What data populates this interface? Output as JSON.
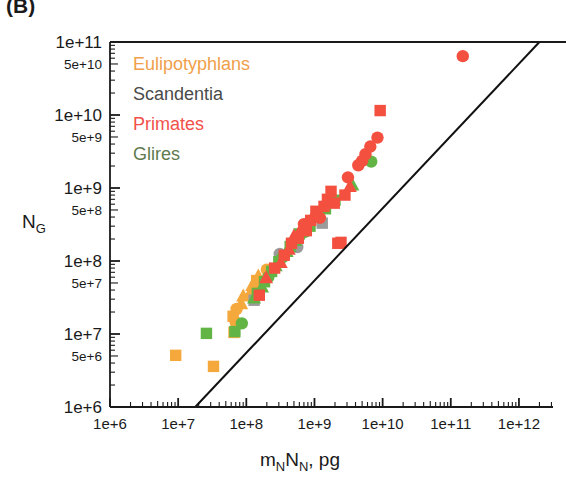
{
  "panel": {
    "label": "(B)"
  },
  "chart_data": {
    "type": "scatter",
    "title": "",
    "subtitle": "",
    "xlabel": "m_N N_N, pg",
    "xlabel_parts": {
      "m": "m",
      "msub": "N",
      "n": "N",
      "nsub": "N",
      "unit": ", pg"
    },
    "ylabel": "N_G",
    "ylabel_parts": {
      "base": "N",
      "sub": "G"
    },
    "xscale": "log",
    "yscale": "log",
    "xlim": [
      1000000.0,
      3160000000000.0
    ],
    "ylim": [
      1000000.0,
      100000000000.0
    ],
    "grid": false,
    "legend_position": "top-left",
    "x_major_ticks": [
      1000000,
      10000000,
      100000000,
      1000000000,
      10000000000,
      100000000000,
      1000000000000
    ],
    "x_tick_labels": [
      "1e+6",
      "1e+7",
      "1e+8",
      "1e+9",
      "1e+10",
      "1e+11",
      "1e+12"
    ],
    "y_major_ticks": [
      1000000,
      10000000,
      100000000,
      1000000000,
      10000000000,
      100000000000
    ],
    "y_major_labels": [
      "1e+6",
      "1e+7",
      "1e+8",
      "1e+9",
      "1e+10",
      "1e+11"
    ],
    "y_minor_ticks": [
      5000000,
      50000000,
      500000000,
      5000000000,
      50000000000
    ],
    "y_minor_labels": [
      "5e+6",
      "5e+7",
      "5e+8",
      "5e+9",
      "5e+10"
    ],
    "fit_line": {
      "x1": 17800000.0,
      "y1": 1000000,
      "x2": 2000000000000.0,
      "y2": 100000000000.0,
      "color": "#111111"
    },
    "legend": [
      {
        "name": "Eulipotyphlans",
        "color": "#F0A04B"
      },
      {
        "name": "Scandentia",
        "color": "#4A4A4A"
      },
      {
        "name": "Primates",
        "color": "#F2504B"
      },
      {
        "name": "Glires",
        "color": "#5E7A4E"
      }
    ],
    "marker_colors": {
      "Eulipotyphlans": "#F5A83C",
      "Scandentia": "#9B9B9B",
      "Primates": "#F4503F",
      "Glires": "#62B544"
    },
    "series": [
      {
        "name": "Eulipotyphlans",
        "color": "#F5A83C",
        "points": [
          {
            "x": 9200000.0,
            "y": 5100000.0,
            "marker": "square"
          },
          {
            "x": 33000000.0,
            "y": 3600000.0,
            "marker": "square"
          },
          {
            "x": 66000000.0,
            "y": 10500000.0,
            "marker": "square"
          },
          {
            "x": 70000000.0,
            "y": 14500000.0,
            "marker": "circle"
          },
          {
            "x": 64000000.0,
            "y": 17500000.0,
            "marker": "square"
          },
          {
            "x": 72000000.0,
            "y": 22000000.0,
            "marker": "circle"
          },
          {
            "x": 84000000.0,
            "y": 26000000.0,
            "marker": "triangle"
          },
          {
            "x": 90000000.0,
            "y": 33000000.0,
            "marker": "triangle"
          },
          {
            "x": 115000000.0,
            "y": 37000000.0,
            "marker": "triangle"
          },
          {
            "x": 122000000.0,
            "y": 46000000.0,
            "marker": "triangle"
          },
          {
            "x": 135000000.0,
            "y": 41000000.0,
            "marker": "circle"
          },
          {
            "x": 142000000.0,
            "y": 54000000.0,
            "marker": "square"
          },
          {
            "x": 150000000.0,
            "y": 62000000.0,
            "marker": "triangle"
          },
          {
            "x": 162000000.0,
            "y": 50000000.0,
            "marker": "circle"
          },
          {
            "x": 200000000.0,
            "y": 76000000.0,
            "marker": "circle"
          }
        ]
      },
      {
        "name": "Scandentia",
        "color": "#9B9B9B",
        "points": [
          {
            "x": 130000000.0,
            "y": 29000000.0,
            "marker": "square"
          },
          {
            "x": 310000000.0,
            "y": 125000000.0,
            "marker": "circle"
          },
          {
            "x": 560000000.0,
            "y": 155000000.0,
            "marker": "circle"
          },
          {
            "x": 1300000000.0,
            "y": 330000000.0,
            "marker": "square"
          }
        ]
      },
      {
        "name": "Primates",
        "color": "#F4503F",
        "points": [
          {
            "x": 155000000.0,
            "y": 34000000.0,
            "marker": "square"
          },
          {
            "x": 195000000.0,
            "y": 59000000.0,
            "marker": "triangle"
          },
          {
            "x": 260000000.0,
            "y": 80000000.0,
            "marker": "square"
          },
          {
            "x": 320000000.0,
            "y": 95000000.0,
            "marker": "triangle"
          },
          {
            "x": 360000000.0,
            "y": 120000000.0,
            "marker": "square"
          },
          {
            "x": 420000000.0,
            "y": 145000000.0,
            "marker": "triangle"
          },
          {
            "x": 460000000.0,
            "y": 175000000.0,
            "marker": "square"
          },
          {
            "x": 500000000.0,
            "y": 220000000.0,
            "marker": "triangle"
          },
          {
            "x": 580000000.0,
            "y": 205000000.0,
            "marker": "square"
          },
          {
            "x": 640000000.0,
            "y": 280000000.0,
            "marker": "triangle"
          },
          {
            "x": 700000000.0,
            "y": 320000000.0,
            "marker": "circle"
          },
          {
            "x": 760000000.0,
            "y": 260000000.0,
            "marker": "square"
          },
          {
            "x": 880000000.0,
            "y": 360000000.0,
            "marker": "square"
          },
          {
            "x": 960000000.0,
            "y": 420000000.0,
            "marker": "triangle"
          },
          {
            "x": 1050000000.0,
            "y": 480000000.0,
            "marker": "square"
          },
          {
            "x": 1200000000.0,
            "y": 390000000.0,
            "marker": "circle"
          },
          {
            "x": 1380000000.0,
            "y": 560000000.0,
            "marker": "square"
          },
          {
            "x": 1550000000.0,
            "y": 700000000.0,
            "marker": "square"
          },
          {
            "x": 1750000000.0,
            "y": 900000000.0,
            "marker": "square"
          },
          {
            "x": 1950000000.0,
            "y": 620000000.0,
            "marker": "square"
          },
          {
            "x": 2200000000.0,
            "y": 175000000.0,
            "marker": "square"
          },
          {
            "x": 2450000000.0,
            "y": 180000000.0,
            "marker": "square"
          },
          {
            "x": 2800000000.0,
            "y": 800000000.0,
            "marker": "square"
          },
          {
            "x": 3300000000.0,
            "y": 1050000000.0,
            "marker": "triangle"
          },
          {
            "x": 3100000000.0,
            "y": 1400000000.0,
            "marker": "circle"
          },
          {
            "x": 4400000000.0,
            "y": 2050000000.0,
            "marker": "circle"
          },
          {
            "x": 5000000000.0,
            "y": 2350000000.0,
            "marker": "circle"
          },
          {
            "x": 5600000000.0,
            "y": 2900000000.0,
            "marker": "circle"
          },
          {
            "x": 6600000000.0,
            "y": 3700000000.0,
            "marker": "circle"
          },
          {
            "x": 8400000000.0,
            "y": 4900000000.0,
            "marker": "circle"
          },
          {
            "x": 9200000000.0,
            "y": 11500000000.0,
            "marker": "square"
          },
          {
            "x": 150000000000.0,
            "y": 64000000000.0,
            "marker": "circle"
          }
        ]
      },
      {
        "name": "Glires",
        "color": "#62B544",
        "points": [
          {
            "x": 26000000.0,
            "y": 10200000.0,
            "marker": "square"
          },
          {
            "x": 68000000.0,
            "y": 10800000.0,
            "marker": "square"
          },
          {
            "x": 86000000.0,
            "y": 14000000.0,
            "marker": "circle"
          },
          {
            "x": 130000000.0,
            "y": 31000000.0,
            "marker": "triangle"
          },
          {
            "x": 145000000.0,
            "y": 36000000.0,
            "marker": "square"
          },
          {
            "x": 170000000.0,
            "y": 44000000.0,
            "marker": "triangle"
          },
          {
            "x": 185000000.0,
            "y": 52000000.0,
            "marker": "square"
          },
          {
            "x": 210000000.0,
            "y": 60000000.0,
            "marker": "circle"
          },
          {
            "x": 235000000.0,
            "y": 72000000.0,
            "marker": "square"
          },
          {
            "x": 270000000.0,
            "y": 86000000.0,
            "marker": "triangle"
          },
          {
            "x": 300000000.0,
            "y": 98000000.0,
            "marker": "square"
          },
          {
            "x": 340000000.0,
            "y": 112000000.0,
            "marker": "circle"
          },
          {
            "x": 390000000.0,
            "y": 135000000.0,
            "marker": "triangle"
          },
          {
            "x": 440000000.0,
            "y": 158000000.0,
            "marker": "square"
          },
          {
            "x": 520000000.0,
            "y": 190000000.0,
            "marker": "triangle"
          },
          {
            "x": 600000000.0,
            "y": 235000000.0,
            "marker": "square"
          },
          {
            "x": 720000000.0,
            "y": 250000000.0,
            "marker": "circle"
          },
          {
            "x": 860000000.0,
            "y": 300000000.0,
            "marker": "square"
          },
          {
            "x": 1100000000.0,
            "y": 400000000.0,
            "marker": "circle"
          },
          {
            "x": 1450000000.0,
            "y": 520000000.0,
            "marker": "square"
          },
          {
            "x": 2000000000.0,
            "y": 680000000.0,
            "marker": "square"
          },
          {
            "x": 3600000000.0,
            "y": 1100000000.0,
            "marker": "triangle"
          },
          {
            "x": 6800000000.0,
            "y": 2300000000.0,
            "marker": "circle"
          }
        ]
      }
    ]
  }
}
